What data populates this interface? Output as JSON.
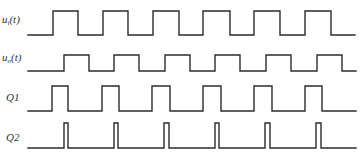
{
  "diagram": {
    "type": "timing-diagram",
    "line_color": "#2b2b2b",
    "label_color": "#333333",
    "background": "#ffffff",
    "signals": [
      {
        "id": "ui",
        "label_main": "u",
        "label_sub": "i",
        "label_tail": "(t)",
        "label_pos": {
          "x": 2,
          "y": 14
        },
        "y_low": 35,
        "y_high": 11,
        "x_start": 28,
        "x_end": 355,
        "initial": "low",
        "edges": [
          53,
          78,
          103,
          128,
          153,
          179,
          203,
          230,
          254,
          280,
          305,
          331
        ]
      },
      {
        "id": "uo",
        "label_main": "u",
        "label_sub": "o",
        "label_tail": "(t)",
        "label_pos": {
          "x": 2,
          "y": 52
        },
        "y_low": 71,
        "y_high": 55,
        "x_start": 28,
        "x_end": 356,
        "initial": "low",
        "edges": [
          64,
          89,
          114,
          139,
          165,
          190,
          215,
          240,
          266,
          291,
          317,
          342
        ]
      },
      {
        "id": "q1",
        "label_main": "Q1",
        "label_sub": "",
        "label_tail": "",
        "label_pos": {
          "x": 6,
          "y": 92
        },
        "y_low": 111,
        "y_high": 86,
        "x_start": 28,
        "x_end": 356,
        "initial": "low",
        "edges": [
          52,
          68,
          102,
          119,
          152,
          170,
          203,
          221,
          254,
          272,
          305,
          322
        ]
      },
      {
        "id": "q2",
        "label_main": "Q2",
        "label_sub": "",
        "label_tail": "",
        "label_pos": {
          "x": 6,
          "y": 132
        },
        "y_low": 148,
        "y_high": 123,
        "x_start": 28,
        "x_end": 356,
        "initial": "low",
        "edges": [
          64,
          68,
          114,
          118,
          164,
          169,
          215,
          219,
          265,
          270,
          316,
          321
        ]
      }
    ]
  }
}
